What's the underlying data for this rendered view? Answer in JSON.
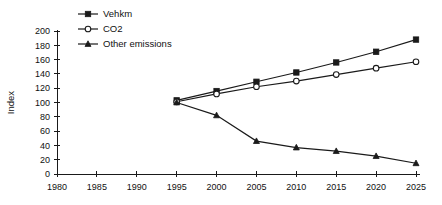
{
  "chart_data": {
    "type": "line",
    "title": "",
    "xlabel": "",
    "ylabel": "Index",
    "x": [
      1995,
      2000,
      2005,
      2010,
      2015,
      2020,
      2025
    ],
    "xlim": [
      1980,
      2025
    ],
    "ylim": [
      0,
      200
    ],
    "xticks": [
      1980,
      1985,
      1990,
      1995,
      2000,
      2005,
      2010,
      2015,
      2020,
      2025
    ],
    "yticks": [
      0,
      20,
      40,
      60,
      80,
      100,
      120,
      140,
      160,
      180,
      200
    ],
    "grid": false,
    "legend_position": "top-left",
    "series": [
      {
        "name": "Vehkm",
        "marker": "filled-square",
        "values": [
          103,
          116,
          129,
          142,
          156,
          171,
          188
        ]
      },
      {
        "name": "CO2",
        "marker": "open-circle",
        "values": [
          101,
          112,
          122,
          130,
          139,
          148,
          157
        ]
      },
      {
        "name": "Other emissions",
        "marker": "filled-triangle",
        "values": [
          100,
          82,
          46,
          37,
          32,
          25,
          15
        ]
      }
    ]
  },
  "axis": {
    "y_label": "Index",
    "y_tick_labels": [
      "200",
      "180",
      "160",
      "140",
      "120",
      "100",
      "80",
      "60",
      "40",
      "20",
      "0"
    ],
    "x_tick_labels": [
      "1980",
      "1985",
      "1990",
      "1995",
      "2000",
      "2005",
      "2010",
      "2015",
      "2020",
      "2025"
    ]
  },
  "legend": {
    "items": [
      {
        "label": "Vehkm",
        "marker": "filled-square"
      },
      {
        "label": "CO2",
        "marker": "open-circle"
      },
      {
        "label": "Other emissions",
        "marker": "filled-triangle"
      }
    ]
  },
  "colors": {
    "ink": "#1a1a1a",
    "background": "#ffffff"
  }
}
